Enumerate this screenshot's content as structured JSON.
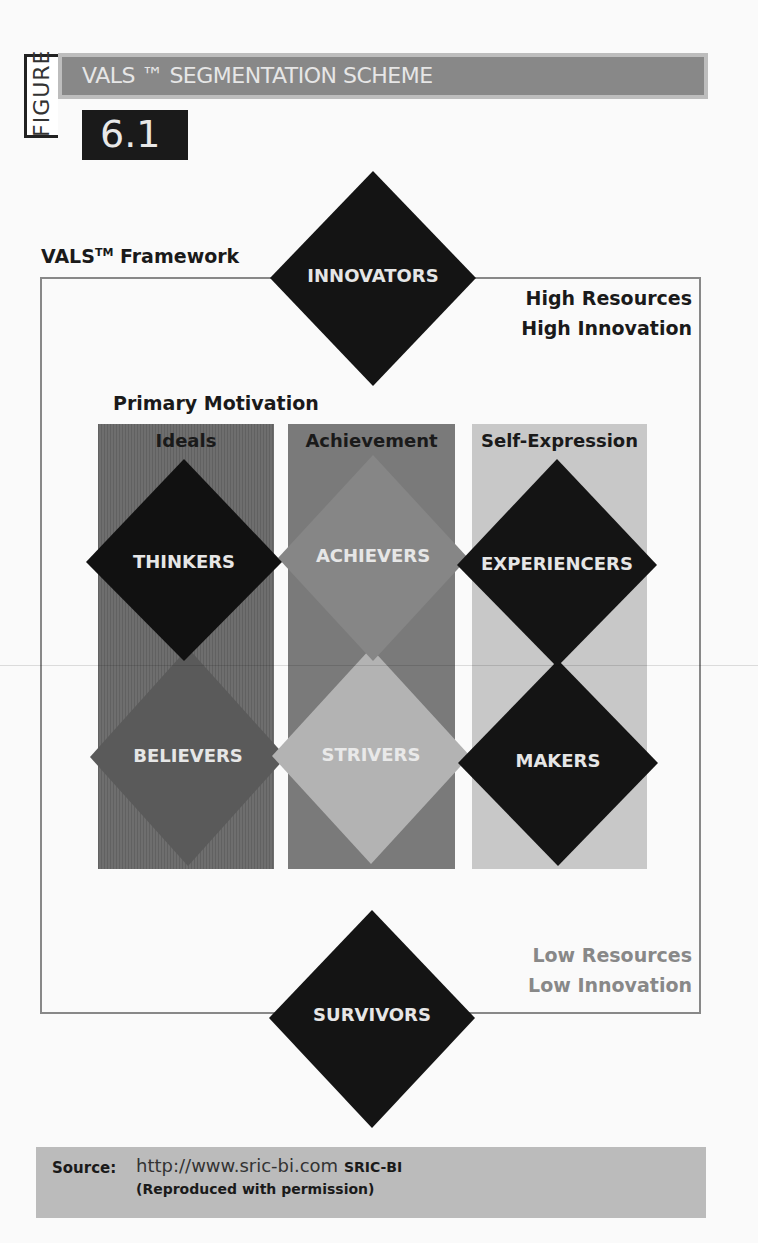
{
  "header": {
    "figure_label": "FIGURE",
    "title": "VALS ™ SEGMENTATION SCHEME",
    "figure_number": "6.1"
  },
  "framework": {
    "title": "VALS",
    "title_tm": "TM",
    "title_suffix": " Framework",
    "high_label_1": "High Resources",
    "high_label_2": "High Innovation",
    "low_label_1": "Low Resources",
    "low_label_2": "Low Innovation",
    "motivation_title": "Primary Motivation",
    "columns": [
      {
        "label": "Ideals",
        "color": "#6e6e6e"
      },
      {
        "label": "Achievement",
        "color": "#7a7a7a"
      },
      {
        "label": "Self-Expression",
        "color": "#c8c8c8"
      }
    ],
    "segments": [
      {
        "label": "INNOVATORS",
        "color": "#141414",
        "position": "top"
      },
      {
        "label": "THINKERS",
        "color": "#111111",
        "column": "Ideals",
        "row": "high"
      },
      {
        "label": "ACHIEVERS",
        "color": "#868686",
        "column": "Achievement",
        "row": "high"
      },
      {
        "label": "EXPERIENCERS",
        "color": "#141414",
        "column": "Self-Expression",
        "row": "high"
      },
      {
        "label": "BELIEVERS",
        "color": "#5a5a5a",
        "column": "Ideals",
        "row": "low"
      },
      {
        "label": "STRIVERS",
        "color": "#b3b3b3",
        "column": "Achievement",
        "row": "low"
      },
      {
        "label": "MAKERS",
        "color": "#141414",
        "column": "Self-Expression",
        "row": "low"
      },
      {
        "label": "SURVIVORS",
        "color": "#141414",
        "position": "bottom"
      }
    ]
  },
  "source": {
    "label": "Source:",
    "url": "http://www.sric-bi.com",
    "org": "SRIC-BI",
    "note": "(Reproduced with permission)"
  }
}
